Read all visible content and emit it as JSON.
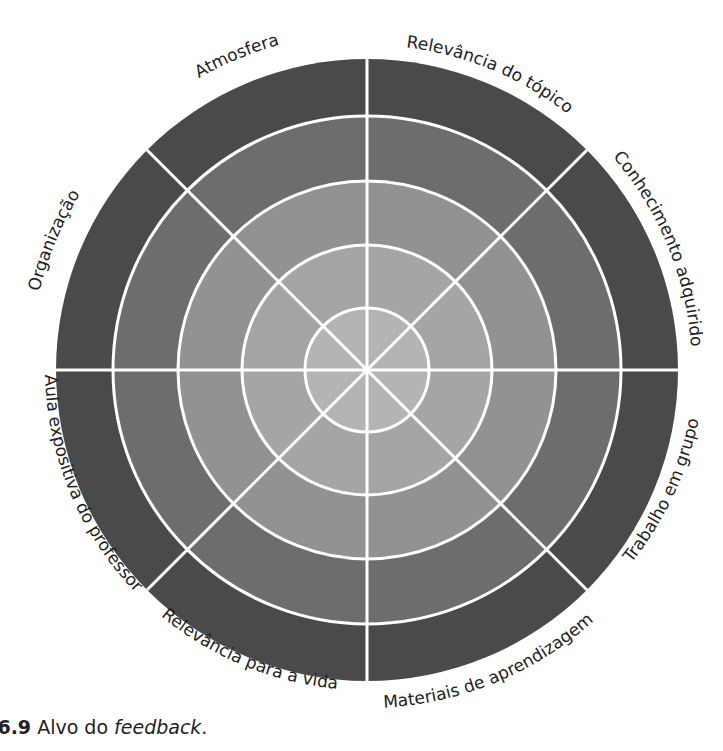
{
  "diagram": {
    "title": "Alvo do feedback",
    "center": {
      "x": 367,
      "y": 370
    },
    "rings": [
      {
        "radius": 311,
        "color": "#4a4a4a"
      },
      {
        "radius": 254,
        "color": "#6d6d6d"
      },
      {
        "radius": 189,
        "color": "#929292"
      },
      {
        "radius": 125,
        "color": "#a5a5a5"
      },
      {
        "radius": 62,
        "color": "#b4b4b4"
      }
    ],
    "spoke_color": "#ffffff",
    "segments": [
      {
        "label": "Relevância do tópico"
      },
      {
        "label": "Conhecimento adquirido"
      },
      {
        "label": "Trabalho em grupo"
      },
      {
        "label": "Materiais de aprendizagem"
      },
      {
        "label": "Relevância para a vida"
      },
      {
        "label": "Aula expositiva do professor"
      },
      {
        "label": "Organização"
      },
      {
        "label": "Atmosfera"
      }
    ]
  },
  "caption": {
    "number": "a 6.9",
    "text_before": " Alvo do ",
    "emphasis": "feedback",
    "text_after": "."
  }
}
